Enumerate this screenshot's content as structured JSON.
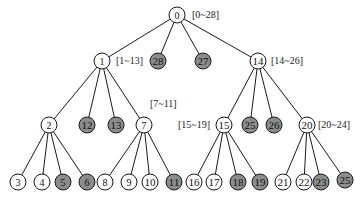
{
  "diagram": {
    "type": "tree",
    "colors": {
      "internal": "#ffffff",
      "leaf_shaded": "#8c8c8c",
      "stroke": "#1a1a1a"
    },
    "nodes": [
      {
        "id": "0",
        "label": "0",
        "x": 177,
        "y": 15,
        "shaded": false,
        "range": "[0~28]",
        "range_x": 192,
        "range_y": 18
      },
      {
        "id": "1",
        "label": "1",
        "x": 102,
        "y": 61,
        "shaded": false,
        "range": "[1~13]",
        "range_x": 116,
        "range_y": 64
      },
      {
        "id": "28",
        "label": "28",
        "x": 158,
        "y": 61,
        "shaded": true
      },
      {
        "id": "27",
        "label": "27",
        "x": 203,
        "y": 61,
        "shaded": true
      },
      {
        "id": "14",
        "label": "14",
        "x": 258,
        "y": 61,
        "shaded": false,
        "range": "[14~26]",
        "range_x": 271,
        "range_y": 64
      },
      {
        "id": "2",
        "label": "2",
        "x": 49,
        "y": 125,
        "shaded": false
      },
      {
        "id": "12",
        "label": "12",
        "x": 87,
        "y": 125,
        "shaded": true
      },
      {
        "id": "13",
        "label": "13",
        "x": 116,
        "y": 125,
        "shaded": true
      },
      {
        "id": "7",
        "label": "7",
        "x": 144,
        "y": 125,
        "shaded": false,
        "range": "[7~11]",
        "range_x": 150,
        "range_y": 107
      },
      {
        "id": "15",
        "label": "15",
        "x": 224,
        "y": 125,
        "shaded": false,
        "range": "[15~19]",
        "range_x": 178,
        "range_y": 128
      },
      {
        "id": "25",
        "label": "25",
        "x": 250,
        "y": 125,
        "shaded": true
      },
      {
        "id": "26",
        "label": "26",
        "x": 274,
        "y": 125,
        "shaded": true
      },
      {
        "id": "20",
        "label": "20",
        "x": 307,
        "y": 125,
        "shaded": false,
        "range": "[20~24]",
        "range_x": 318,
        "range_y": 128
      },
      {
        "id": "3",
        "label": "3",
        "x": 18,
        "y": 182,
        "shaded": false
      },
      {
        "id": "4",
        "label": "4",
        "x": 42,
        "y": 182,
        "shaded": false
      },
      {
        "id": "5",
        "label": "5",
        "x": 63,
        "y": 182,
        "shaded": true
      },
      {
        "id": "6",
        "label": "6",
        "x": 87,
        "y": 182,
        "shaded": true
      },
      {
        "id": "8",
        "label": "8",
        "x": 105,
        "y": 182,
        "shaded": false
      },
      {
        "id": "9",
        "label": "9",
        "x": 129,
        "y": 182,
        "shaded": false
      },
      {
        "id": "10",
        "label": "10",
        "x": 150,
        "y": 182,
        "shaded": false
      },
      {
        "id": "11",
        "label": "11",
        "x": 174,
        "y": 182,
        "shaded": true
      },
      {
        "id": "16",
        "label": "16",
        "x": 194,
        "y": 182,
        "shaded": false
      },
      {
        "id": "17",
        "label": "17",
        "x": 214,
        "y": 182,
        "shaded": false
      },
      {
        "id": "18",
        "label": "18",
        "x": 238,
        "y": 182,
        "shaded": true
      },
      {
        "id": "19",
        "label": "19",
        "x": 260,
        "y": 182,
        "shaded": true
      },
      {
        "id": "21",
        "label": "21",
        "x": 283,
        "y": 182,
        "shaded": false
      },
      {
        "id": "22",
        "label": "22",
        "x": 304,
        "y": 182,
        "shaded": false
      },
      {
        "id": "23",
        "label": "23",
        "x": 321,
        "y": 182,
        "shaded": true
      },
      {
        "id": "24",
        "label": "25",
        "x": 345,
        "y": 180,
        "shaded": true
      }
    ],
    "edges": [
      [
        "0",
        "1"
      ],
      [
        "0",
        "28"
      ],
      [
        "0",
        "27"
      ],
      [
        "0",
        "14"
      ],
      [
        "1",
        "2"
      ],
      [
        "1",
        "12"
      ],
      [
        "1",
        "13"
      ],
      [
        "1",
        "7"
      ],
      [
        "14",
        "15"
      ],
      [
        "14",
        "25"
      ],
      [
        "14",
        "26"
      ],
      [
        "14",
        "20"
      ],
      [
        "2",
        "3"
      ],
      [
        "2",
        "4"
      ],
      [
        "2",
        "5"
      ],
      [
        "2",
        "6"
      ],
      [
        "7",
        "8"
      ],
      [
        "7",
        "9"
      ],
      [
        "7",
        "10"
      ],
      [
        "7",
        "11"
      ],
      [
        "15",
        "16"
      ],
      [
        "15",
        "17"
      ],
      [
        "15",
        "18"
      ],
      [
        "15",
        "19"
      ],
      [
        "20",
        "21"
      ],
      [
        "20",
        "22"
      ],
      [
        "20",
        "23"
      ],
      [
        "20",
        "24"
      ]
    ]
  }
}
